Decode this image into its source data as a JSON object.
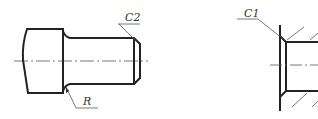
{
  "diagram": {
    "type": "mechanical-drawing",
    "views": [
      {
        "id": "left-view",
        "description": "stepped shaft with chamfer and fillet",
        "annotations": {
          "chamfer_label": "C2",
          "radius_label": "R"
        }
      },
      {
        "id": "right-view",
        "description": "hole with chamfer in sectioned part",
        "annotations": {
          "chamfer_label": "C1"
        }
      }
    ],
    "colors": {
      "outline": "#222222",
      "thin": "#555555",
      "background": "#ffffff"
    }
  }
}
